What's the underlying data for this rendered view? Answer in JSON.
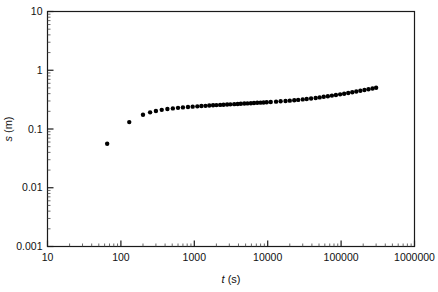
{
  "chart_data": {
    "type": "scatter",
    "title": "",
    "xlabel": "t (s)",
    "ylabel": "s (m)",
    "xscale": "log",
    "yscale": "log",
    "xlim": [
      10,
      1000000
    ],
    "ylim": [
      0.001,
      10
    ],
    "grid": false,
    "legend_position": "none",
    "marker": "filled-circle",
    "marker_color": "#000000",
    "xticks": [
      10,
      100,
      1000,
      10000,
      100000,
      1000000
    ],
    "xtick_labels": [
      "10",
      "100",
      "1000",
      "10000",
      "100000",
      "1000000"
    ],
    "yticks": [
      0.001,
      0.01,
      0.1,
      1,
      10
    ],
    "ytick_labels": [
      "0.001",
      "0.01",
      "0.1",
      "1",
      "10"
    ],
    "minor_ticks": true,
    "annotations": [
      {
        "text": "Early Theis type response",
        "x": 56,
        "y": 560,
        "anchor": "start"
      },
      {
        "text": "Delayed gravity response",
        "x": 1500,
        "y": 1150,
        "anchor": "start"
      },
      {
        "text": "Late Theis type response",
        "x": 26000,
        "y": 370,
        "anchor": "start"
      }
    ],
    "series": [
      {
        "name": "drawdown",
        "points": [
          [
            65,
            0.056
          ],
          [
            130,
            0.131
          ],
          [
            200,
            0.175
          ],
          [
            250,
            0.192
          ],
          [
            300,
            0.203
          ],
          [
            360,
            0.212
          ],
          [
            430,
            0.219
          ],
          [
            510,
            0.224
          ],
          [
            600,
            0.229
          ],
          [
            700,
            0.233
          ],
          [
            820,
            0.237
          ],
          [
            950,
            0.24
          ],
          [
            1100,
            0.243
          ],
          [
            1250,
            0.246
          ],
          [
            1420,
            0.248
          ],
          [
            1600,
            0.251
          ],
          [
            1800,
            0.253
          ],
          [
            2000,
            0.255
          ],
          [
            2250,
            0.257
          ],
          [
            2500,
            0.259
          ],
          [
            2800,
            0.261
          ],
          [
            3100,
            0.263
          ],
          [
            3500,
            0.265
          ],
          [
            3900,
            0.267
          ],
          [
            4300,
            0.269
          ],
          [
            4800,
            0.271
          ],
          [
            5300,
            0.273
          ],
          [
            5900,
            0.275
          ],
          [
            6500,
            0.277
          ],
          [
            7200,
            0.279
          ],
          [
            8000,
            0.281
          ],
          [
            8800,
            0.283
          ],
          [
            9700,
            0.285
          ],
          [
            11000,
            0.288
          ],
          [
            13000,
            0.292
          ],
          [
            15000,
            0.296
          ],
          [
            17500,
            0.3
          ],
          [
            20000,
            0.304
          ],
          [
            23000,
            0.309
          ],
          [
            26000,
            0.313
          ],
          [
            30000,
            0.319
          ],
          [
            34000,
            0.325
          ],
          [
            39000,
            0.331
          ],
          [
            45000,
            0.338
          ],
          [
            51000,
            0.345
          ],
          [
            58000,
            0.353
          ],
          [
            66000,
            0.361
          ],
          [
            75000,
            0.37
          ],
          [
            85000,
            0.379
          ],
          [
            97000,
            0.389
          ],
          [
            110000,
            0.399
          ],
          [
            125000,
            0.41
          ],
          [
            142000,
            0.422
          ],
          [
            161000,
            0.434
          ],
          [
            183000,
            0.447
          ],
          [
            208000,
            0.46
          ],
          [
            236000,
            0.474
          ],
          [
            268000,
            0.489
          ],
          [
            300000,
            0.503
          ]
        ]
      }
    ]
  },
  "axes": {
    "x_title": "t (s)",
    "x_title_italic": "t",
    "x_title_rest": " (s)",
    "y_title_italic": "s",
    "y_title_rest": " (m)"
  }
}
